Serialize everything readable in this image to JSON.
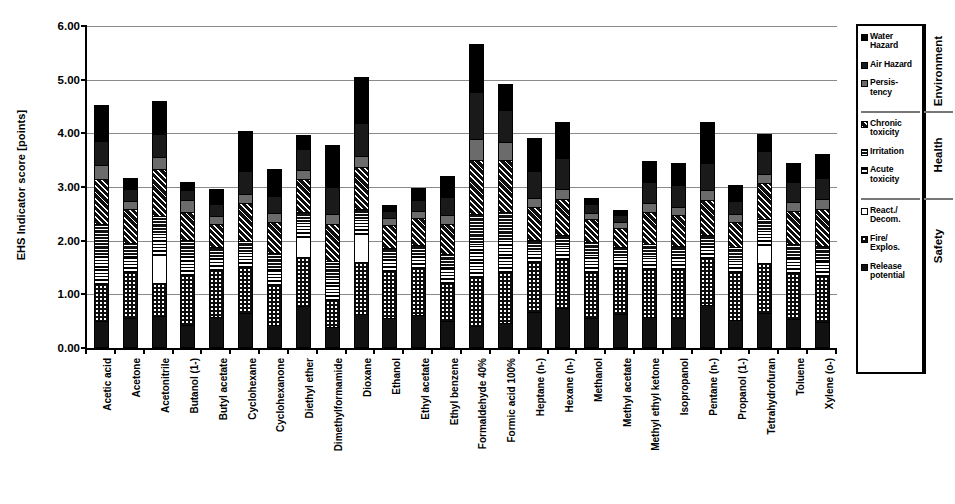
{
  "chart_data": {
    "type": "bar",
    "subtype": "stacked-column",
    "title": "",
    "xlabel": "",
    "ylabel": "EHS Indicator score [points]",
    "ylim": [
      0,
      6
    ],
    "ytick_step": 1,
    "ytick_labels": [
      "0.00",
      "1.00",
      "2.00",
      "3.00",
      "4.00",
      "5.00",
      "6.00"
    ],
    "grid": true,
    "legend_position": "right",
    "categories": [
      "Acetic acid",
      "Acetone",
      "Acetonitrile",
      "Butanol (1-)",
      "Butyl acetate",
      "Cyclohexane",
      "Cyclohexanone",
      "Diethyl ether",
      "Dimethylformamide",
      "Dioxane",
      "Ethanol",
      "Ethyl acetate",
      "Ethyl benzene",
      "Formaldehyde 40%",
      "Formic acid 100%",
      "Heptane (n-)",
      "Hexane (n-)",
      "Methanol",
      "Methyl acetate",
      "Methyl ethyl ketone",
      "Isopropanol",
      "Pentane (n-)",
      "Propanol (1-)",
      "Tetrahydrofuran",
      "Toluene",
      "Xylene (o-)"
    ],
    "totals": [
      4.5,
      3.13,
      4.57,
      3.06,
      2.92,
      4.0,
      3.3,
      3.94,
      3.75,
      5.01,
      2.63,
      2.94,
      3.17,
      5.63,
      4.88,
      3.88,
      4.17,
      2.76,
      2.54,
      3.44,
      3.41,
      4.17,
      3.0,
      3.95,
      3.41,
      3.57
    ],
    "series": [
      {
        "name": "Release potential",
        "key": "release",
        "values": [
          0.46,
          0.52,
          0.55,
          0.4,
          0.54,
          0.62,
          0.4,
          0.74,
          0.36,
          0.6,
          0.52,
          0.58,
          0.46,
          0.38,
          0.42,
          0.64,
          0.7,
          0.52,
          0.6,
          0.54,
          0.52,
          0.76,
          0.48,
          0.62,
          0.5,
          0.44
        ]
      },
      {
        "name": "Fire/Explos.",
        "key": "fire",
        "values": [
          0.7,
          0.86,
          0.62,
          0.92,
          0.88,
          0.86,
          0.74,
          0.92,
          0.5,
          0.96,
          0.88,
          0.88,
          0.72,
          0.9,
          0.96,
          0.92,
          0.92,
          0.86,
          0.86,
          0.9,
          0.92,
          0.88,
          0.9,
          0.92,
          0.86,
          0.86
        ]
      },
      {
        "name": "React./Decom.",
        "key": "react",
        "values": [
          0.0,
          0.0,
          0.52,
          0.0,
          0.0,
          0.0,
          0.0,
          0.38,
          0.0,
          0.52,
          0.0,
          0.0,
          0.0,
          0.0,
          0.0,
          0.0,
          0.0,
          0.0,
          0.0,
          0.0,
          0.0,
          0.0,
          0.0,
          0.34,
          0.0,
          0.0
        ]
      },
      {
        "name": "Acute toxicity",
        "key": "acute",
        "values": [
          0.52,
          0.3,
          0.4,
          0.36,
          0.22,
          0.26,
          0.3,
          0.26,
          0.38,
          0.26,
          0.22,
          0.22,
          0.3,
          0.62,
          0.58,
          0.22,
          0.24,
          0.32,
          0.2,
          0.24,
          0.22,
          0.22,
          0.24,
          0.26,
          0.3,
          0.3
        ]
      },
      {
        "name": "Irritation",
        "key": "irritation",
        "values": [
          0.6,
          0.24,
          0.34,
          0.3,
          0.2,
          0.22,
          0.3,
          0.2,
          0.34,
          0.22,
          0.2,
          0.2,
          0.24,
          0.56,
          0.54,
          0.2,
          0.2,
          0.24,
          0.18,
          0.22,
          0.2,
          0.2,
          0.22,
          0.22,
          0.24,
          0.26
        ]
      },
      {
        "name": "Chronic toxicity",
        "key": "chronic",
        "values": [
          0.84,
          0.64,
          0.86,
          0.52,
          0.44,
          0.7,
          0.58,
          0.62,
          0.7,
          0.78,
          0.44,
          0.5,
          0.56,
          1.0,
          0.96,
          0.62,
          0.68,
          0.42,
          0.36,
          0.6,
          0.58,
          0.66,
          0.48,
          0.68,
          0.62,
          0.7
        ]
      },
      {
        "name": "Persistency",
        "key": "persistency",
        "values": [
          0.26,
          0.14,
          0.24,
          0.22,
          0.14,
          0.18,
          0.16,
          0.16,
          0.18,
          0.2,
          0.12,
          0.14,
          0.16,
          0.4,
          0.34,
          0.16,
          0.18,
          0.12,
          0.12,
          0.16,
          0.16,
          0.18,
          0.14,
          0.16,
          0.16,
          0.18
        ]
      },
      {
        "name": "Air Hazard",
        "key": "air",
        "values": [
          0.44,
          0.22,
          0.42,
          0.18,
          0.22,
          0.42,
          0.32,
          0.4,
          0.5,
          0.62,
          0.14,
          0.2,
          0.34,
          0.88,
          0.6,
          0.5,
          0.58,
          0.16,
          0.12,
          0.4,
          0.4,
          0.52,
          0.24,
          0.44,
          0.38,
          0.4
        ]
      },
      {
        "name": "Water Hazard",
        "key": "water",
        "values": [
          0.68,
          0.21,
          0.62,
          0.16,
          0.28,
          0.74,
          0.5,
          0.26,
          0.79,
          0.85,
          0.11,
          0.22,
          0.39,
          0.89,
          0.48,
          0.62,
          0.67,
          0.12,
          0.1,
          0.38,
          0.41,
          0.75,
          0.3,
          0.31,
          0.35,
          0.43
        ]
      }
    ]
  },
  "legend": {
    "groups": [
      {
        "title": "Environment",
        "items": [
          {
            "label": "Water Hazard",
            "key": "water",
            "swatch": "solid-black"
          },
          {
            "label": "Air Hazard",
            "key": "air",
            "swatch": "solid-dark"
          },
          {
            "label": "Persis-\ntency",
            "key": "persistency",
            "swatch": "solid-gray"
          }
        ]
      },
      {
        "title": "Health",
        "items": [
          {
            "label": "Chronic\ntoxicity",
            "key": "chronic",
            "swatch": "diagonal-hatch"
          },
          {
            "label": "Irritation",
            "key": "irritation",
            "swatch": "horizontal-hatch"
          },
          {
            "label": "Acute\ntoxicity",
            "key": "acute",
            "swatch": "vertical-hatch"
          }
        ]
      },
      {
        "title": "Safety",
        "items": [
          {
            "label": "React./\nDecom.",
            "key": "react",
            "swatch": "white-empty"
          },
          {
            "label": "Fire/\nExplos.",
            "key": "fire",
            "swatch": "coarse-dots"
          },
          {
            "label": "Release\npotential",
            "key": "release",
            "swatch": "fine-dots"
          }
        ]
      }
    ]
  },
  "colors": {
    "black": "#000000",
    "dark": "#1a1a1a",
    "gray": "#6b6b6b",
    "white": "#ffffff",
    "gridline": "#8a8a8a"
  }
}
